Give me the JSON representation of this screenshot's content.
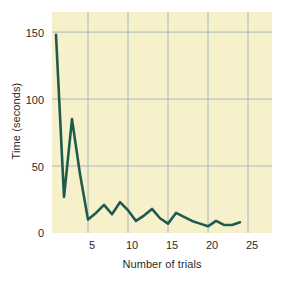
{
  "chart_data": {
    "type": "line",
    "title": "",
    "xlabel": "Number of trials",
    "ylabel": "Time (seconds)",
    "xlim": [
      0.5,
      28
    ],
    "ylim": [
      0,
      165
    ],
    "xticks": [
      5,
      10,
      15,
      20,
      25
    ],
    "yticks": [
      0,
      50,
      100,
      150
    ],
    "xticklabels": [
      "5",
      "10",
      "15",
      "20",
      "25"
    ],
    "yticklabels": [
      "0",
      "50",
      "100",
      "150"
    ],
    "grid": true,
    "legend": null,
    "line_color": "#1d5c4c",
    "plot_background": "#f6f0cb",
    "grid_color": "#aab8bd",
    "series": [
      {
        "name": "Time per trial",
        "x": [
          1,
          2,
          3,
          4,
          5,
          6,
          7,
          8,
          9,
          10,
          11,
          12,
          13,
          14,
          15,
          16,
          17,
          18,
          19,
          20,
          21,
          22,
          23,
          24
        ],
        "values": [
          148,
          27,
          85,
          44,
          10,
          15,
          21,
          14,
          23,
          17,
          9,
          13,
          18,
          11,
          7,
          15,
          12,
          9,
          7,
          5,
          9,
          6,
          6,
          8
        ]
      }
    ]
  },
  "axes": {
    "ylabel_text": "Time (seconds)",
    "xlabel_text": "Number of trials",
    "yticklabels": [
      "150",
      "100",
      "50",
      "0"
    ],
    "xticklabels": [
      "5",
      "10",
      "15",
      "20",
      "25"
    ]
  }
}
